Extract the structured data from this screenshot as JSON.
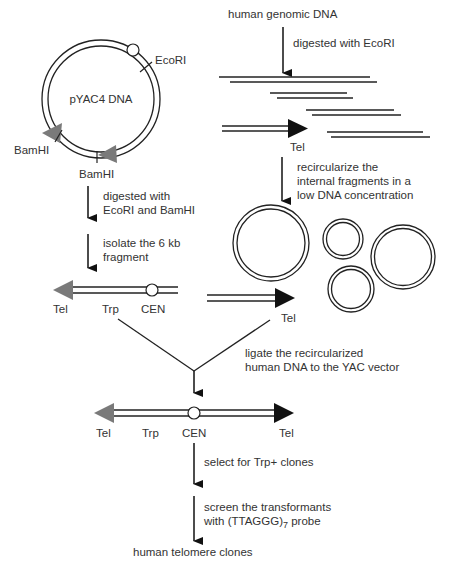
{
  "colors": {
    "line": "#222222",
    "text": "#333333",
    "tel_left": "#7a7a7a",
    "tel_right": "#111111",
    "background": "#ffffff"
  },
  "plasmid": {
    "name": "pYAC4 DNA",
    "site_ecori": "EcoRI",
    "site_bamhi_1": "BamHI",
    "site_bamhi_2": "BamHI"
  },
  "steps_left": {
    "step1_line1": "digested with",
    "step1_line2": "EcoRI and BamHI",
    "step2_line1": "isolate the 6 kb",
    "step2_line2": "fragment"
  },
  "left_arm": {
    "tel": "Tel",
    "trp": "Trp",
    "cen": "CEN"
  },
  "right_arm": {
    "tel": "Tel"
  },
  "human": {
    "title": "human genomic DNA",
    "digest": "digested with EcoRI",
    "tel": "Tel",
    "recirc_line1": "recircularize the",
    "recirc_line2": "internal fragments in a",
    "recirc_line3": "low DNA concentration"
  },
  "ligate": {
    "line1": "ligate the recircularized",
    "line2": "human DNA to the YAC vector"
  },
  "construct": {
    "tel_left": "Tel",
    "trp": "Trp",
    "cen": "CEN",
    "tel_right": "Tel"
  },
  "select": {
    "label": "select for Trp+ clones"
  },
  "screen": {
    "line1": "screen the transformants",
    "line2_prefix": "with (TTAGGG)",
    "line2_sub": "7",
    "line2_suffix": " probe"
  },
  "result": {
    "label": "human telomere clones"
  }
}
